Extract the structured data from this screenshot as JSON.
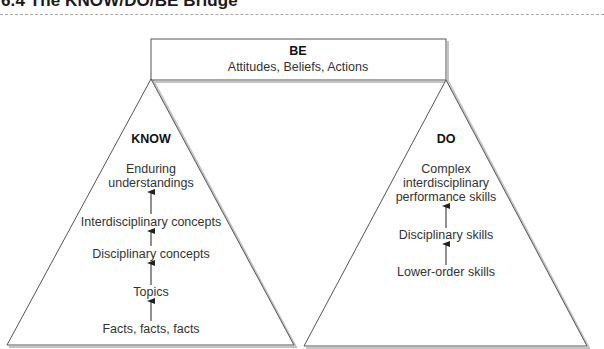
{
  "title": "6.4 The KNOW/DO/BE Bridge",
  "be": {
    "heading": "BE",
    "subtitle": "Attitudes, Beliefs, Actions"
  },
  "know": {
    "heading": "KNOW",
    "levels": [
      "Enduring",
      "understandings",
      "Interdisciplinary concepts",
      "Disciplinary concepts",
      "Topics",
      "Facts, facts, facts"
    ]
  },
  "do": {
    "heading": "DO",
    "levels": [
      "Complex",
      "interdisciplinary",
      "performance skills",
      "Disciplinary skills",
      "Lower-order skills"
    ]
  },
  "colors": {
    "line": "#555555",
    "shadow": "#bdbdbd",
    "text": "#333333"
  }
}
